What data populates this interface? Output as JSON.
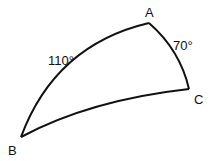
{
  "diagram": {
    "type": "spherical-triangle",
    "vertices": {
      "A": {
        "label": "A"
      },
      "B": {
        "label": "B"
      },
      "C": {
        "label": "C"
      }
    },
    "sides": {
      "AB": {
        "label": "110°"
      },
      "AC": {
        "label": "70°"
      },
      "BC": {
        "label": ""
      }
    },
    "stroke_color": "#111111"
  }
}
